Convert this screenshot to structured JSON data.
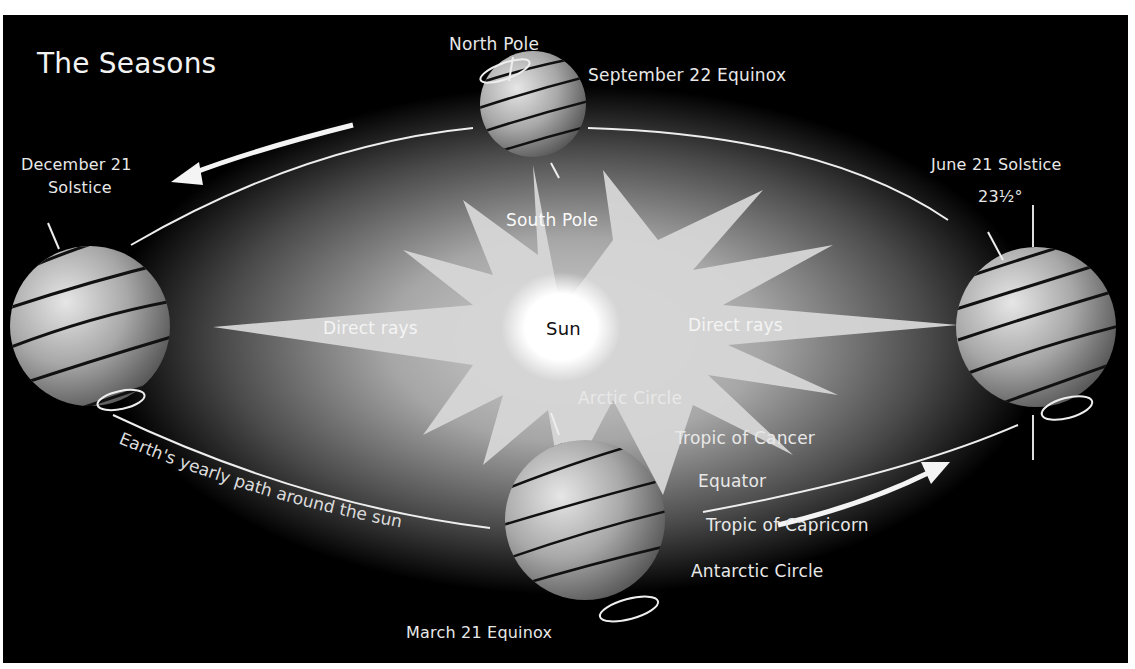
{
  "diagram": {
    "title": "The Seasons",
    "center": {
      "label": "Sun"
    },
    "rays": {
      "left_label": "Direct rays",
      "right_label": "Direct rays"
    },
    "orbit": {
      "path_label": "Earth's yearly path around the sun",
      "direction": "counter-clockwise (as drawn)"
    },
    "positions": [
      {
        "id": "sep",
        "label": "September 22 Equinox",
        "pole_top": "North Pole",
        "pole_bottom": "South Pole"
      },
      {
        "id": "dec",
        "label_line1": "December 21",
        "label_line2": "Solstice"
      },
      {
        "id": "jun",
        "label": "June 21 Solstice",
        "tilt": "23½°"
      },
      {
        "id": "mar",
        "label": "March 21 Equinox"
      }
    ],
    "latitude_lines": [
      "Arctic Circle",
      "Tropic of Cancer",
      "Equator",
      "Tropic of Capricorn",
      "Antarctic Circle"
    ],
    "colors": {
      "background": "#000000",
      "glow": "#d9d9d9",
      "sun_core": "#ffffff",
      "orbit_line": "#eeeeee",
      "text": "#e8e8e8"
    }
  }
}
